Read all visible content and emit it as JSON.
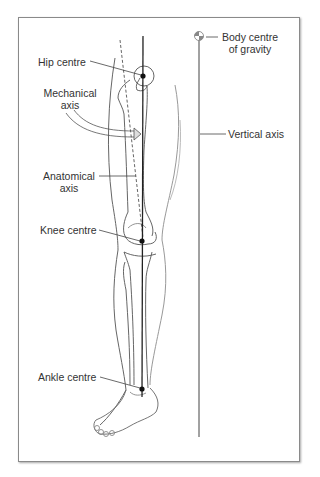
{
  "figure": {
    "labels": {
      "hip_centre": "Hip centre",
      "mechanical_axis_line1": "Mechanical",
      "mechanical_axis_line2": "axis",
      "anatomical_axis_line1": "Anatomical",
      "anatomical_axis_line2": "axis",
      "knee_centre": "Knee centre",
      "ankle_centre": "Ankle centre",
      "body_cog_line1": "Body centre",
      "body_cog_line2": "of gravity",
      "vertical_axis": "Vertical axis"
    },
    "icons": {
      "body_centre_of_gravity": "centre-of-gravity-symbol",
      "joint_centre": "filled-dot"
    },
    "colors": {
      "line": "#333333",
      "outline": "#555555",
      "frame": "#8a8a8a",
      "text": "#333333"
    }
  }
}
